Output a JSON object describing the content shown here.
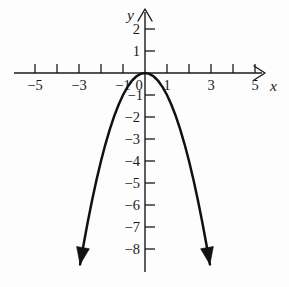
{
  "figure": {
    "background_color": "#fdfdfd",
    "ink_color": "#1a1a1a",
    "curve_color": "#111111"
  },
  "axes": {
    "x_axis_name": "x",
    "y_axis_name": "y",
    "origin_label": "0"
  },
  "chart_data": {
    "type": "line",
    "title": "",
    "subtitle": "",
    "xlabel": "x",
    "ylabel": "y",
    "equation": "y = -x^2",
    "grid": false,
    "legend": false,
    "xlim": [
      -5.6,
      5.6
    ],
    "ylim": [
      -8.7,
      2.5
    ],
    "x_ticks": [
      -5,
      -4,
      -3,
      -2,
      -1,
      0,
      1,
      2,
      3,
      4,
      5
    ],
    "x_tick_labels": [
      "-5",
      "",
      "-3",
      "",
      "-1",
      "0",
      "1",
      "",
      "3",
      "",
      "5"
    ],
    "x_labeled_ticks": [
      {
        "value": -5,
        "label": "−5"
      },
      {
        "value": -3,
        "label": "−3"
      },
      {
        "value": -1,
        "label": "−1"
      },
      {
        "value": 1,
        "label": "1"
      },
      {
        "value": 3,
        "label": "3"
      },
      {
        "value": 5,
        "label": "5"
      }
    ],
    "y_ticks": [
      2,
      1,
      -1,
      -2,
      -3,
      -4,
      -5,
      -6,
      -7,
      -8
    ],
    "y_labeled_ticks": [
      {
        "value": 2,
        "label": "2"
      },
      {
        "value": 1,
        "label": "1"
      },
      {
        "value": -1,
        "label": "−1"
      },
      {
        "value": -2,
        "label": "−2"
      },
      {
        "value": -3,
        "label": "−3"
      },
      {
        "value": -4,
        "label": "−4"
      },
      {
        "value": -5,
        "label": "−5"
      },
      {
        "value": -6,
        "label": "−6"
      },
      {
        "value": -7,
        "label": "−7"
      },
      {
        "value": -8,
        "label": "−8"
      }
    ],
    "vertex": {
      "x": 0,
      "y": 0
    },
    "x": [
      -2.95,
      -2.8,
      -2.6,
      -2.4,
      -2.2,
      -2.0,
      -1.8,
      -1.6,
      -1.4,
      -1.2,
      -1.0,
      -0.8,
      -0.6,
      -0.4,
      -0.2,
      0,
      0.2,
      0.4,
      0.6,
      0.8,
      1.0,
      1.2,
      1.4,
      1.6,
      1.8,
      2.0,
      2.2,
      2.4,
      2.6,
      2.8,
      2.95
    ],
    "y": [
      -8.7,
      -7.84,
      -6.76,
      -5.76,
      -4.84,
      -4.0,
      -3.24,
      -2.56,
      -1.96,
      -1.44,
      -1.0,
      -0.64,
      -0.36,
      -0.16,
      -0.04,
      0,
      -0.04,
      -0.16,
      -0.36,
      -0.64,
      -1.0,
      -1.44,
      -1.96,
      -2.56,
      -3.24,
      -4.0,
      -4.84,
      -5.76,
      -6.76,
      -7.84,
      -8.7
    ],
    "endpoints_arrows": [
      "down-left",
      "down-right"
    ]
  }
}
